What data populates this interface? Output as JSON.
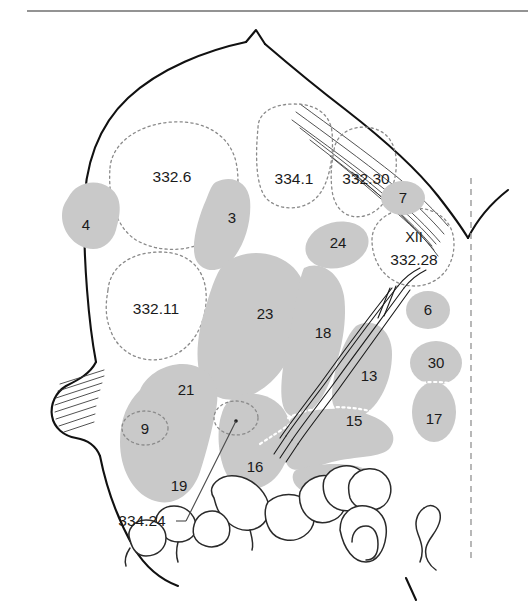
{
  "figure": {
    "colors": {
      "organ_gray": "#c9c9c9",
      "outline_black": "#111111",
      "dashed_gray": "#8a8a8a",
      "midline_gray": "#9a9a9a",
      "background": "#ffffff"
    }
  },
  "labels": {
    "region_332_6": "332.6",
    "region_334_1": "334.1",
    "region_332_30": "332.30",
    "region_332_11": "332.11",
    "region_xii": "XII",
    "region_332_28": "332.28",
    "structure_3": "3",
    "structure_4": "4",
    "structure_6": "6",
    "structure_7": "7",
    "structure_9": "9",
    "structure_13": "13",
    "structure_15": "15",
    "structure_16": "16",
    "structure_17": "17",
    "structure_18": "18",
    "structure_19": "19",
    "structure_21": "21",
    "structure_23": "23",
    "structure_24": "24",
    "structure_30": "30",
    "callout_334_24": "334.24"
  }
}
